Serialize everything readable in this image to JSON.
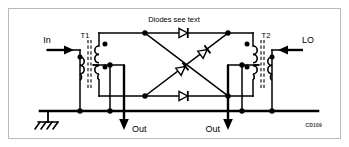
{
  "figure": {
    "kind": "schematic",
    "id_caption": "CD109",
    "frame_color": "#b9b9b9",
    "line_color": "#000000",
    "background": "#ffffff",
    "width": 349,
    "height": 147
  },
  "labels": {
    "note": "Diodes see text",
    "port_in": "In",
    "port_lo": "LO",
    "port_out_left": "Out",
    "port_out_right": "Out",
    "transformer_left": "T1",
    "transformer_right": "T2"
  },
  "components": {
    "transformers": [
      {
        "ref": "T1",
        "side": "left",
        "role": "input-balun"
      },
      {
        "ref": "T2",
        "side": "right",
        "role": "lo-balun"
      }
    ],
    "diodes": [
      {
        "id": "D1",
        "position": "top",
        "direction": "right"
      },
      {
        "id": "D2",
        "position": "upper-diagonal",
        "direction": "up-right"
      },
      {
        "id": "D3",
        "position": "lower-diagonal",
        "direction": "up-right"
      },
      {
        "id": "D4",
        "position": "bottom",
        "direction": "right"
      }
    ],
    "ground": {
      "symbol": "earth-ground",
      "position": "bottom-left"
    },
    "bus": {
      "name": "ground-bus",
      "orientation": "horizontal"
    }
  },
  "arrows": {
    "in_direction": "right",
    "lo_direction": "left",
    "out_left_direction": "down",
    "out_right_direction": "down"
  }
}
